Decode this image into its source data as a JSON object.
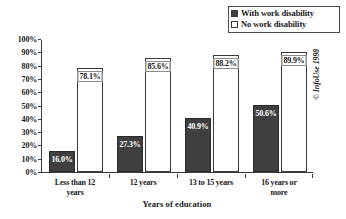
{
  "chart_data": {
    "type": "bar",
    "title": "",
    "subtitle": "",
    "xlabel": "Years of education",
    "ylabel": "",
    "categories": [
      "Less than 12 years",
      "12 years",
      "13 to 15 years",
      "16 years or more"
    ],
    "category_lines": [
      [
        "Less than 12",
        "years"
      ],
      [
        "12 years"
      ],
      [
        "13 to 15 years"
      ],
      [
        "16 years or",
        "more"
      ]
    ],
    "series": [
      {
        "name": "With work disability",
        "values": [
          16.0,
          27.3,
          40.9,
          50.6
        ],
        "labels": [
          "16.0%",
          "27.3%",
          "40.9%",
          "50.6%"
        ],
        "color": "#3f3f3f",
        "marker": "filled-square"
      },
      {
        "name": "No work disability",
        "values": [
          78.1,
          85.6,
          88.2,
          89.9
        ],
        "labels": [
          "78.1%",
          "85.6%",
          "88.2%",
          "89.9%"
        ],
        "color": "#ffffff",
        "marker": "hollow-square"
      }
    ],
    "ylim": [
      0,
      100
    ],
    "ytick_values": [
      100,
      90,
      80,
      70,
      60,
      50,
      40,
      30,
      20,
      10,
      0
    ],
    "yticks": [
      "100%",
      "90%",
      "80%",
      "70%",
      "60%",
      "50%",
      "40%",
      "30%",
      "20%",
      "10%",
      "0%"
    ],
    "grid": false,
    "legend_position": "top-right"
  },
  "legend": {
    "items": [
      {
        "label": "With work disability",
        "marker": "filled-square"
      },
      {
        "label": "No work disability",
        "marker": "hollow-square"
      }
    ]
  },
  "copyright": "© InfoUse 1998"
}
